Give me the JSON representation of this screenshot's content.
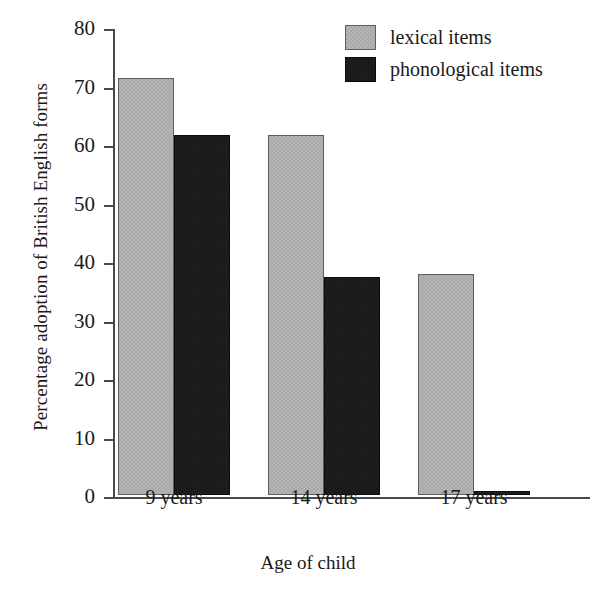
{
  "chart_data": {
    "type": "bar",
    "title": "",
    "xlabel": "Age of child",
    "ylabel": "Percentage adoption of British English forms",
    "categories": [
      "9 years",
      "14 years",
      "17 years"
    ],
    "series": [
      {
        "name": "lexical items",
        "values": [
          71.3,
          61.6,
          37.7
        ],
        "color": "#a9a9a9"
      },
      {
        "name": "phonological items",
        "values": [
          61.6,
          37.3,
          0.7
        ],
        "color": "#161616"
      }
    ],
    "ylim": [
      0,
      80
    ],
    "ytick_step": 10,
    "yticks": [
      80,
      70,
      60,
      50,
      40,
      30,
      20,
      10,
      0
    ],
    "ytick_labels": [
      "80",
      "70",
      "60",
      "50",
      "40",
      "30",
      "20",
      "10",
      "0"
    ],
    "grid": false,
    "legend_position": "top-right",
    "legend": [
      "lexical items",
      "phonological items"
    ]
  }
}
